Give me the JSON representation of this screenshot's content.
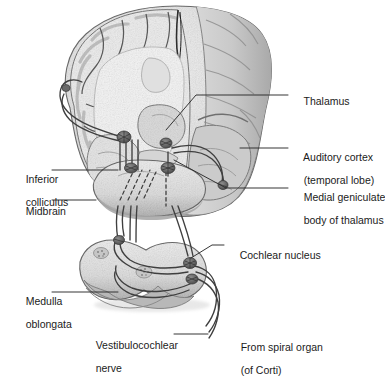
{
  "figure": {
    "type": "anatomical-diagram",
    "background_color": "#ffffff",
    "line_color": "#3a3a3a",
    "text_color": "#1b1b1b",
    "tissue_color": "#e8e8e8",
    "tissue_shade_color": "#b9b9b9",
    "nerve_color": "#4a4a4a"
  },
  "labels": [
    {
      "id": "thalamus",
      "text": "Thalamus",
      "text2": "",
      "x": 292,
      "y": 84,
      "side": "right"
    },
    {
      "id": "auditory-cortex",
      "text": "Auditory cortex",
      "text2": "(temporal lobe)",
      "x": 292,
      "y": 140,
      "side": "right"
    },
    {
      "id": "medial-geniculate",
      "text": "Medial geniculate",
      "text2": "body of thalamus",
      "x": 292,
      "y": 180,
      "side": "right"
    },
    {
      "id": "cochlear-nucleus",
      "text": "Cochlear nucleus",
      "text2": "",
      "x": 228,
      "y": 238,
      "side": "right"
    },
    {
      "id": "from-spiral-organ",
      "text": "From spiral organ",
      "text2": "(of Corti)",
      "x": 229,
      "y": 330,
      "side": "right"
    },
    {
      "id": "inferior-colliculus",
      "text": "Inferior",
      "text2": "colliculus",
      "x": 14,
      "y": 162,
      "side": "left"
    },
    {
      "id": "midbrain",
      "text": "Midbrain",
      "text2": "",
      "x": 14,
      "y": 196,
      "side": "left"
    },
    {
      "id": "medulla-oblongata",
      "text": "Medulla",
      "text2": "oblongata",
      "x": 14,
      "y": 284,
      "side": "left"
    },
    {
      "id": "vestibulocochlear",
      "text": "Vestibulocochlear",
      "text2": "nerve",
      "x": 84,
      "y": 328,
      "side": "left"
    }
  ],
  "structures": [
    {
      "id": "cerebrum",
      "name": "Cerebrum (coronal section with gyri and sulci)"
    },
    {
      "id": "thalamus-body",
      "name": "Thalamus"
    },
    {
      "id": "midbrain-body",
      "name": "Midbrain"
    },
    {
      "id": "medulla-body",
      "name": "Medulla oblongata"
    },
    {
      "id": "inferior-colliculus-node",
      "name": "Inferior colliculus"
    },
    {
      "id": "medial-geniculate-node",
      "name": "Medial geniculate body"
    },
    {
      "id": "cochlear-nucleus-node",
      "name": "Cochlear nucleus"
    },
    {
      "id": "vestibulocochlear-nerve",
      "name": "Vestibulocochlear nerve"
    },
    {
      "id": "decussation-fibers",
      "name": "Decussating auditory fibers (dashed)"
    }
  ]
}
